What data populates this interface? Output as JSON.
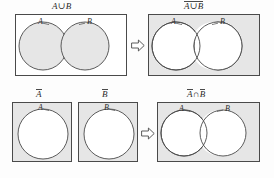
{
  "figure": {
    "title_semantics": "de-morgan-law-venn-diagrams",
    "colors": {
      "shade": "#e6e6e6",
      "stroke": "#4a4a4a",
      "background": "#fdfdfd",
      "text": "#2b2b2b"
    }
  },
  "panels": [
    {
      "id": "a-union-b",
      "caption": {
        "pre": "",
        "overlined": "",
        "plain": "A∪B"
      },
      "box": {
        "x": 15,
        "y": 14,
        "w": 112,
        "h": 62,
        "fill": "white"
      },
      "circles": [
        {
          "label": "A",
          "cx": 42,
          "cy": 45,
          "r": 24,
          "fill": "shade"
        },
        {
          "label": "B",
          "cx": 84,
          "cy": 45,
          "r": 24,
          "fill": "shade"
        }
      ],
      "labels": [
        {
          "text": "A",
          "x": 37,
          "y": 22
        },
        {
          "text": "B",
          "x": 88,
          "y": 22
        }
      ]
    },
    {
      "id": "complement-a-union-b",
      "caption": {
        "pre": "",
        "overlined": "A∪B",
        "plain": ""
      },
      "box": {
        "x": 148,
        "y": 14,
        "w": 112,
        "h": 62,
        "fill": "gray"
      },
      "circles": [
        {
          "label": "A",
          "cx": 175,
          "cy": 45,
          "r": 24,
          "fill": "white"
        },
        {
          "label": "B",
          "cx": 217,
          "cy": 45,
          "r": 24,
          "fill": "white"
        }
      ],
      "labels": [
        {
          "text": "A",
          "x": 170,
          "y": 22
        },
        {
          "text": "B",
          "x": 221,
          "y": 22
        }
      ]
    },
    {
      "id": "complement-a",
      "caption": {
        "pre": "",
        "overlined": "A",
        "plain": ""
      },
      "box": {
        "x": 12,
        "y": 102,
        "w": 60,
        "h": 60,
        "fill": "gray"
      },
      "circles": [
        {
          "label": "A",
          "cx": 42,
          "cy": 133,
          "r": 25,
          "fill": "white"
        }
      ],
      "labels": [
        {
          "text": "A",
          "x": 38,
          "y": 108
        }
      ]
    },
    {
      "id": "complement-b",
      "caption": {
        "pre": "",
        "overlined": "B",
        "plain": ""
      },
      "box": {
        "x": 78,
        "y": 102,
        "w": 60,
        "h": 60,
        "fill": "gray"
      },
      "circles": [
        {
          "label": "B",
          "cx": 108,
          "cy": 133,
          "r": 25,
          "fill": "white"
        }
      ],
      "labels": [
        {
          "text": "B",
          "x": 104,
          "y": 108
        }
      ]
    },
    {
      "id": "complement-a-intersect-complement-b",
      "caption": {
        "pre": "",
        "overlined": "A",
        "mid": "∩",
        "overlined2": "B",
        "plain": ""
      },
      "box": {
        "x": 157,
        "y": 102,
        "w": 103,
        "h": 60,
        "fill": "gray"
      },
      "circles": [
        {
          "label": "A",
          "cx": 183,
          "cy": 132,
          "r": 23,
          "fill": "white"
        },
        {
          "label": "B",
          "cx": 222,
          "cy": 132,
          "r": 23,
          "fill": "white"
        }
      ],
      "labels": [
        {
          "text": "A",
          "x": 178,
          "y": 109
        },
        {
          "text": "B",
          "x": 226,
          "y": 109
        }
      ]
    }
  ],
  "arrows": [
    {
      "id": "arrow-top",
      "x": 131,
      "y": 38,
      "direction": "right",
      "glyph": "hollow-right-arrow"
    },
    {
      "id": "arrow-bottom",
      "x": 141,
      "y": 126,
      "direction": "right",
      "glyph": "hollow-right-arrow"
    }
  ],
  "captions": {
    "a_union_b": "A∪B",
    "complement_a_union_b": "A∪B",
    "complement_a": "A",
    "complement_b": "B",
    "complement_a_label": "A",
    "complement_b_label": "B",
    "intersect_symbol": "∩"
  },
  "circle_labels": {
    "a": "A",
    "b": "B"
  }
}
